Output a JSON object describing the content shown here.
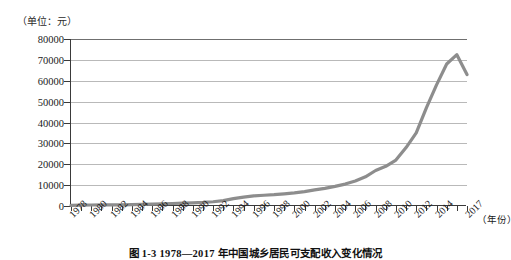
{
  "figure": {
    "unit_label": "（单位：元）",
    "x_axis_unit": "（年份）",
    "caption": "图 1-3  1978—2017 年中国城乡居民可支配收入变化情况"
  },
  "colors": {
    "series_line": "#8d8d8d",
    "gridline": "#b9b9b9",
    "axis": "#3a3a3a",
    "background": "#ffffff"
  },
  "chart_data": {
    "type": "line",
    "title": "",
    "xlabel": "（年份）",
    "ylabel": "（单位：元）",
    "xlim": [
      1978,
      2017
    ],
    "ylim": [
      0,
      80000
    ],
    "ytick_labels": [
      "80000",
      "70000",
      "60000",
      "50000",
      "40000",
      "30000",
      "20000",
      "10000",
      "0"
    ],
    "ytick_values": [
      80000,
      70000,
      60000,
      50000,
      40000,
      30000,
      20000,
      10000,
      0
    ],
    "xtick_labels": [
      "1978",
      "1980",
      "1982",
      "1984",
      "1986",
      "1988",
      "1990",
      "1992",
      "1994",
      "1996",
      "1998",
      "2000",
      "2002",
      "2004",
      "2006",
      "2008",
      "2010",
      "2012",
      "2014",
      "2017"
    ],
    "xtick_values": [
      1978,
      1980,
      1982,
      1984,
      1986,
      1988,
      1990,
      1992,
      1994,
      1996,
      1998,
      2000,
      2002,
      2004,
      2006,
      2008,
      2010,
      2012,
      2014,
      2017
    ],
    "grid": true,
    "legend": false,
    "series": [
      {
        "name": "收入",
        "x": [
          1978,
          1979,
          1980,
          1981,
          1982,
          1983,
          1984,
          1985,
          1986,
          1987,
          1988,
          1989,
          1990,
          1991,
          1992,
          1993,
          1994,
          1995,
          1996,
          1997,
          1998,
          1999,
          2000,
          2001,
          2002,
          2003,
          2004,
          2005,
          2006,
          2007,
          2008,
          2009,
          2010,
          2011,
          2012,
          2013,
          2014,
          2015,
          2016,
          2017
        ],
        "values": [
          343,
          387,
          478,
          500,
          535,
          565,
          660,
          740,
          900,
          1000,
          1200,
          1350,
          1510,
          1700,
          2030,
          2580,
          3500,
          4280,
          4840,
          5160,
          5420,
          5850,
          6280,
          6860,
          7700,
          8470,
          9420,
          10500,
          12000,
          14000,
          17000,
          19000,
          22000,
          28000,
          35000,
          47000,
          58000,
          68000,
          72500,
          63000
        ]
      }
    ]
  }
}
